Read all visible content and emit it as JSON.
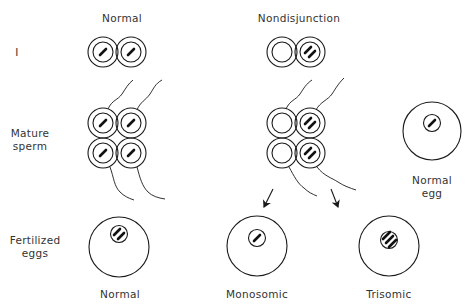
{
  "columns": {
    "normal": "Normal",
    "nondisjunction": "Nondisjunction"
  },
  "rows": {
    "division_i": "I",
    "mature_sperm_line1": "Mature",
    "mature_sperm_line2": "sperm",
    "fertilized_line1": "Fertilized",
    "fertilized_line2": "eggs"
  },
  "egg": {
    "label_line1": "Normal",
    "label_line2": "egg",
    "chromosomes": 1
  },
  "outcomes": [
    {
      "label": "Normal",
      "chromosomes": 2
    },
    {
      "label": "Monosomic",
      "chromosomes": 1
    },
    {
      "label": "Trisomic",
      "chromosomes": 3
    }
  ],
  "cells": {
    "normal_meiosis_i": [
      1,
      1
    ],
    "nondisjunction_meiosis_i": [
      0,
      2
    ],
    "normal_sperm": [
      1,
      1,
      1,
      1
    ],
    "nondisjunction_sperm": [
      0,
      2,
      0,
      2
    ]
  },
  "colors": {
    "stroke": "#1a1a1a",
    "text": "#333333",
    "background": "#ffffff"
  }
}
